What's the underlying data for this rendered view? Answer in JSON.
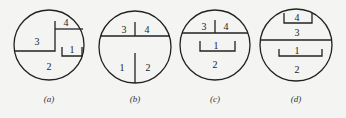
{
  "figure": {
    "panels": [
      {
        "id": "a",
        "caption": "(a)",
        "regions": [
          "1",
          "2",
          "3",
          "4"
        ]
      },
      {
        "id": "b",
        "caption": "(b)",
        "regions": [
          "1",
          "2",
          "3",
          "4"
        ]
      },
      {
        "id": "c",
        "caption": "(c)",
        "regions": [
          "1",
          "2",
          "3",
          "4"
        ]
      },
      {
        "id": "d",
        "caption": "(d)",
        "regions": [
          "1",
          "2",
          "3",
          "4"
        ]
      }
    ]
  },
  "colors": {
    "line": "#222222",
    "background": "#f4f4f2"
  }
}
